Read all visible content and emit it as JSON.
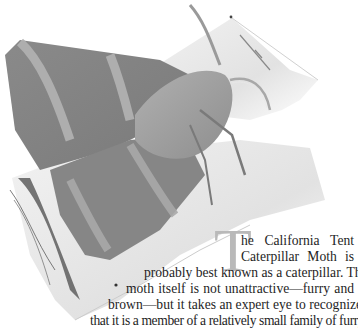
{
  "illustration": {
    "subject": "California Tent Caterpillar Moth on a birch branch",
    "style": "grayscale pencil illustration",
    "colors": {
      "wing_dark": "#7d7d7d",
      "wing_mid": "#9a9a9a",
      "wing_band": "#b5b5b5",
      "branch": "#e6e6e6",
      "branch_shadow": "#cfcfcf",
      "bark_dark": "#4a4a4a"
    }
  },
  "article": {
    "drop_cap": "T",
    "drop_cap_color": "#b9b9b9",
    "lines": [
      "he California Tent",
      "Caterpillar Moth is",
      "probably best known as a caterpillar. The",
      "moth itself is not unattractive—furry and",
      "brown—but it takes an expert eye to recognize",
      "that it is a member of a relatively small family of furry,"
    ]
  }
}
